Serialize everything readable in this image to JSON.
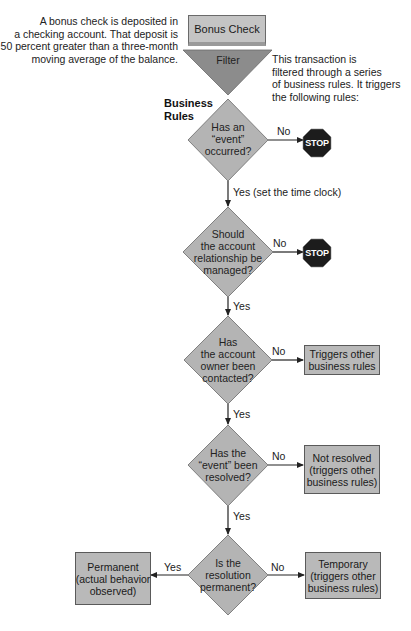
{
  "notes": {
    "top_cutoff": "",
    "left_note": [
      "A bonus check is deposited in",
      "a checking account. That deposit is",
      "50 percent greater than a three-month",
      "moving average of the balance."
    ],
    "right_note": [
      "This transaction is",
      "filtered through a series",
      "of business rules. It triggers",
      "the following rules:"
    ],
    "section_title": [
      "Business",
      "Rules"
    ]
  },
  "start": {
    "label": "Bonus Check",
    "filter_label": "Filter"
  },
  "decisions": [
    {
      "id": "event-occurred",
      "lines": [
        "Has an",
        "“event”",
        "occurred?"
      ],
      "no_label": "No",
      "no_target": "STOP",
      "yes_label": "Yes (set the time clock)"
    },
    {
      "id": "relationship-managed",
      "lines": [
        "Should",
        "the account",
        "relationship be",
        "managed?"
      ],
      "no_label": "No",
      "no_target": "STOP",
      "yes_label": "Yes"
    },
    {
      "id": "owner-contacted",
      "lines": [
        "Has",
        "the account",
        "owner been",
        "contacted?"
      ],
      "no_label": "No",
      "no_target_lines": [
        "Triggers other",
        "business rules"
      ],
      "yes_label": "Yes"
    },
    {
      "id": "event-resolved",
      "lines": [
        "Has the",
        "“event” been",
        "resolved?"
      ],
      "no_label": "No",
      "no_target_lines": [
        "Not resolved",
        "(triggers other",
        "business rules)"
      ],
      "yes_label": "Yes"
    },
    {
      "id": "resolution-permanent",
      "lines": [
        "Is the",
        "resolution",
        "permanent?"
      ],
      "no_label": "No",
      "no_target_lines": [
        "Temporary",
        "(triggers other",
        "business rules)"
      ],
      "yes_label": "Yes",
      "yes_target_lines": [
        "Permanent",
        "(actual behavior",
        "observed)"
      ]
    }
  ],
  "stop_sign": {
    "label": "STOP"
  },
  "colors": {
    "diamond_fill": "#b4b4b4",
    "diamond_stroke": "#6a6a6a",
    "filter_fill": "#8c8c8c",
    "box_fill": "#b9b9b9",
    "stop_fill": "#1c1c1c",
    "line": "#222222"
  }
}
